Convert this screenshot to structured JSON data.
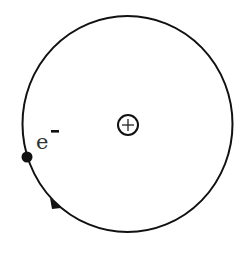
{
  "diagram": {
    "title": "",
    "orbit": {
      "cx": 127.5,
      "cy": 124,
      "rx": 105,
      "ry": 108,
      "stroke": "#111111",
      "stroke_width": 2
    },
    "nucleus": {
      "cx": 128,
      "cy": 125,
      "r": 10,
      "symbol": "+",
      "label": "nucleus (positive charge)"
    },
    "electron": {
      "cx": 27,
      "cy": 157,
      "r": 5.5,
      "label": "e",
      "charge": "-"
    },
    "arrow": {
      "direction": "counterclockwise-down",
      "x": 58,
      "y": 205
    },
    "colors": {
      "line": "#111111",
      "text": "#333333",
      "background": "#ffffff"
    }
  }
}
